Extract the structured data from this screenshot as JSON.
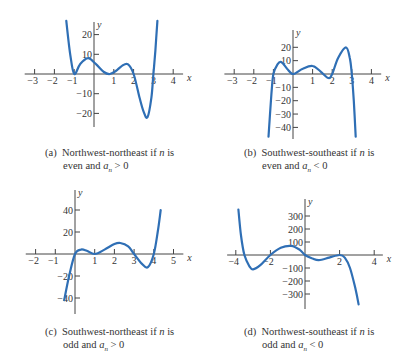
{
  "figure": {
    "panels": [
      {
        "id": "a",
        "caption_prefix": "(a)",
        "caption_line1_pre": "Northwest-northeast if ",
        "caption_var": "n",
        "caption_line1_post": " is",
        "caption_line2_pre": "even and ",
        "caption_coef": "a",
        "caption_coef_sub": "n",
        "caption_line2_post": " > 0"
      },
      {
        "id": "b",
        "caption_prefix": "(b)",
        "caption_line1_pre": "Southwest-southeast if ",
        "caption_var": "n",
        "caption_line1_post": " is",
        "caption_line2_pre": "even and ",
        "caption_coef": "a",
        "caption_coef_sub": "n",
        "caption_line2_post": " < 0"
      },
      {
        "id": "c",
        "caption_prefix": "(c)",
        "caption_line1_pre": "Southwest-northeast if ",
        "caption_var": "n",
        "caption_line1_post": " is",
        "caption_line2_pre": "odd and ",
        "caption_coef": "a",
        "caption_coef_sub": "n",
        "caption_line2_post": " > 0"
      },
      {
        "id": "d",
        "caption_prefix": "(d)",
        "caption_line1_pre": "Northwest-southeast if ",
        "caption_var": "n",
        "caption_line1_post": " is",
        "caption_line2_pre": "odd and ",
        "caption_coef": "a",
        "caption_coef_sub": "n",
        "caption_line2_post": " < 0"
      }
    ]
  },
  "colors": {
    "curve": "#2f6fb5",
    "axis": "#444444",
    "text": "#333333"
  },
  "chart_data": [
    {
      "type": "line",
      "title": "(a) Northwest-northeast if n is even and a_n > 0",
      "xlabel": "x",
      "ylabel": "y",
      "xlim": [
        -3.5,
        4.5
      ],
      "ylim": [
        -28,
        28
      ],
      "xticks": [
        -3,
        -2,
        -1,
        1,
        2,
        3,
        4
      ],
      "yticks": [
        -20,
        -10,
        10,
        20
      ],
      "grid": false,
      "series": [
        {
          "name": "polynomial",
          "x": [
            -1.4,
            -1.2,
            -1.0,
            -0.7,
            -0.3,
            0.1,
            0.5,
            0.8,
            1.1,
            1.4,
            1.7,
            2.0,
            2.3,
            2.5,
            2.7,
            2.9,
            3.0,
            3.1,
            3.2
          ],
          "y": [
            27,
            10,
            0,
            5,
            8,
            5,
            1,
            0,
            1.5,
            4,
            5,
            0,
            -12,
            -19,
            -22,
            -12,
            0,
            12,
            27
          ]
        }
      ]
    },
    {
      "type": "line",
      "title": "(b) Southwest-southeast if n is even and a_n < 0",
      "xlabel": "x",
      "ylabel": "y",
      "xlim": [
        -3.5,
        4.5
      ],
      "ylim": [
        -48,
        30
      ],
      "xticks": [
        -3,
        -2,
        -1,
        1,
        2,
        3,
        4
      ],
      "yticks": [
        -40,
        -30,
        -20,
        -10,
        10,
        20
      ],
      "grid": false,
      "series": [
        {
          "name": "polynomial",
          "x": [
            -1.25,
            -1.1,
            -1.0,
            -0.8,
            -0.6,
            -0.3,
            0.0,
            0.5,
            1.0,
            1.4,
            1.8,
            2.0,
            2.3,
            2.7,
            2.9,
            3.0,
            3.1,
            3.2
          ],
          "y": [
            -47,
            -15,
            0,
            7,
            9,
            4,
            0,
            4,
            6,
            2,
            -3,
            0,
            12,
            20,
            12,
            0,
            -20,
            -47
          ]
        }
      ]
    },
    {
      "type": "line",
      "title": "(c) Southwest-northeast if n is odd and a_n > 0",
      "xlabel": "x",
      "ylabel": "y",
      "xlim": [
        -2.5,
        5.5
      ],
      "ylim": [
        -48,
        50
      ],
      "xticks": [
        -2,
        -1,
        1,
        2,
        3,
        4,
        5
      ],
      "yticks": [
        -40,
        -20,
        20,
        40
      ],
      "grid": false,
      "series": [
        {
          "name": "polynomial",
          "x": [
            -0.55,
            -0.3,
            0.0,
            0.3,
            0.6,
            1.0,
            1.5,
            2.0,
            2.3,
            2.7,
            3.0,
            3.4,
            3.7,
            4.0,
            4.2,
            4.35
          ],
          "y": [
            -42,
            -20,
            0,
            4,
            3,
            0,
            4,
            9,
            10,
            7,
            0,
            -9,
            -12,
            0,
            20,
            40
          ]
        }
      ]
    },
    {
      "type": "line",
      "title": "(d) Northwest-southeast if n is odd and a_n < 0",
      "xlabel": "x",
      "ylabel": "y",
      "xlim": [
        -4.5,
        4.5
      ],
      "ylim": [
        -400,
        400
      ],
      "xticks": [
        -4,
        -2,
        2,
        4
      ],
      "yticks": [
        -300,
        -200,
        -100,
        100,
        200,
        300
      ],
      "grid": false,
      "series": [
        {
          "name": "polynomial",
          "x": [
            -3.85,
            -3.7,
            -3.5,
            -3.2,
            -3.0,
            -2.6,
            -2.0,
            -1.4,
            -0.8,
            -0.3,
            0.0,
            0.4,
            0.8,
            1.4,
            2.0,
            2.3,
            2.6,
            2.9,
            3.1
          ],
          "y": [
            350,
            150,
            0,
            -90,
            -110,
            -80,
            0,
            55,
            70,
            40,
            0,
            -25,
            -40,
            -20,
            0,
            -20,
            -100,
            -250,
            -380
          ]
        }
      ]
    }
  ]
}
